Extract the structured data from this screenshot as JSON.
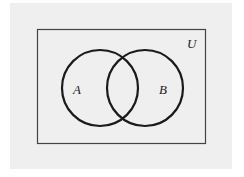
{
  "diagram": {
    "type": "venn",
    "universe_label": "U",
    "sets": [
      {
        "label": "A",
        "cx": 100,
        "cy": 88,
        "r": 38
      },
      {
        "label": "B",
        "cx": 145,
        "cy": 88,
        "r": 38
      }
    ],
    "colors": {
      "background": "#efefef",
      "stroke": "#1a1a1a",
      "frame": "#444444"
    }
  }
}
